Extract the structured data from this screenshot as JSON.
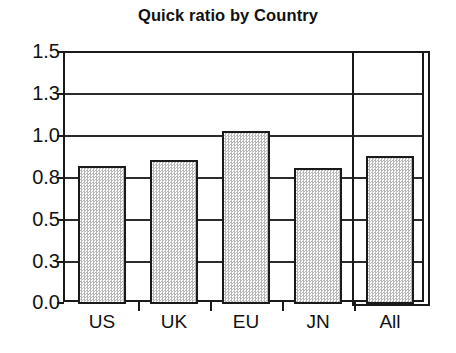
{
  "chart_data": {
    "type": "bar",
    "title": "Quick ratio by Country",
    "xlabel": "",
    "ylabel": "",
    "categories": [
      "US",
      "UK",
      "EU",
      "JN",
      "All"
    ],
    "values": [
      0.81,
      0.85,
      1.02,
      0.8,
      0.87
    ],
    "ylim": [
      0.0,
      1.5
    ],
    "yticks": [
      0.0,
      0.25,
      0.5,
      0.75,
      1.0,
      1.25,
      1.5
    ],
    "ytick_labels": [
      "0.0",
      "0.3",
      "0.5",
      "0.8",
      "1.0",
      "1.3",
      "1.5"
    ],
    "grid": true,
    "legend": false,
    "bar_fill": "#d9d9d9",
    "bar_edge": "#1a1a1a",
    "annotations": [
      {
        "type": "highlight-box",
        "target_category": "All",
        "description": "rectangle outlining the All column"
      }
    ]
  }
}
